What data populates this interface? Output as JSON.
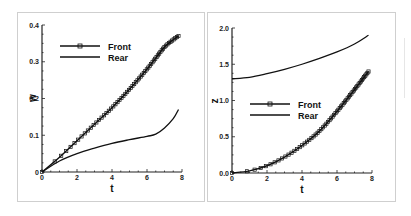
{
  "chart_data": [
    {
      "type": "line",
      "title": "",
      "xlabel": "t",
      "ylabel": "w",
      "xlim": [
        0,
        8
      ],
      "ylim": [
        0,
        0.4
      ],
      "xticks": [
        "0",
        "2",
        "4",
        "6",
        "8"
      ],
      "yticks": [
        "0",
        "0.1",
        "0.2",
        "0.3",
        "0.4"
      ],
      "grid": false,
      "legend_position": "upper-left",
      "series": [
        {
          "name": "Front",
          "marker": "square",
          "x": [
            0,
            1,
            2,
            3,
            4,
            5,
            6,
            6.5,
            7,
            7.5,
            7.8
          ],
          "y": [
            0,
            0.04,
            0.085,
            0.13,
            0.175,
            0.225,
            0.28,
            0.31,
            0.34,
            0.36,
            0.37
          ]
        },
        {
          "name": "Rear",
          "marker": "none",
          "x": [
            0,
            1,
            2,
            3,
            4,
            5,
            6,
            6.5,
            7,
            7.5,
            7.8
          ],
          "y": [
            0,
            0.03,
            0.05,
            0.065,
            0.078,
            0.088,
            0.097,
            0.103,
            0.12,
            0.145,
            0.17
          ]
        }
      ]
    },
    {
      "type": "line",
      "title": "",
      "xlabel": "t",
      "ylabel": "z",
      "xlim": [
        0,
        8
      ],
      "ylim": [
        0,
        2.0
      ],
      "xticks": [
        "0",
        "2",
        "4",
        "6",
        "8"
      ],
      "yticks": [
        "0.0",
        "0.5",
        "1.0",
        "1.5",
        "2.0"
      ],
      "grid": false,
      "legend_position": "center-left",
      "series": [
        {
          "name": "Front",
          "marker": "square",
          "x": [
            0,
            1,
            2,
            3,
            4,
            5,
            6,
            7,
            7.8
          ],
          "y": [
            0,
            0.03,
            0.1,
            0.22,
            0.38,
            0.58,
            0.85,
            1.15,
            1.4
          ]
        },
        {
          "name": "Rear",
          "marker": "none",
          "x": [
            0,
            1,
            2,
            3,
            4,
            5,
            6,
            7,
            7.8
          ],
          "y": [
            1.3,
            1.32,
            1.37,
            1.43,
            1.5,
            1.58,
            1.67,
            1.78,
            1.9
          ]
        }
      ]
    }
  ],
  "left": {
    "xlabel": "t",
    "ylabel": "w",
    "xticks": [
      "0",
      "2",
      "4",
      "6",
      "8"
    ],
    "yticks": [
      "0",
      "0.1",
      "0.2",
      "0.3",
      "0.4"
    ],
    "legend": {
      "front": "Front",
      "rear": "Rear"
    }
  },
  "right": {
    "xlabel": "t",
    "ylabel": "z",
    "xticks": [
      "0",
      "2",
      "4",
      "6",
      "8"
    ],
    "yticks": [
      "0.0",
      "0.5",
      "1.0",
      "1.5",
      "2.0"
    ],
    "legend": {
      "front": "Front",
      "rear": "Rear"
    }
  },
  "colors": {
    "line": "#111111",
    "axis": "#222222",
    "frame": "#cfcfcf"
  }
}
